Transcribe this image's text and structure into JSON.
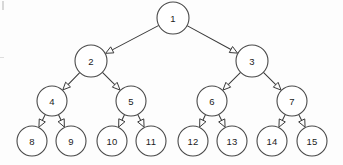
{
  "diagram": {
    "background_color": "#fdfdfd",
    "node_stroke_color": "#4a4a4a",
    "node_fill_color": "#ffffff",
    "edge_color": "#3a3a3a",
    "arrow_style": "open-triangle",
    "levels": 4,
    "node_count": 15
  },
  "nodes": [
    {
      "id": "n1",
      "label": "1",
      "cx": 173,
      "cy": 18,
      "r": 16,
      "level": 0
    },
    {
      "id": "n2",
      "label": "2",
      "cx": 91,
      "cy": 61,
      "r": 16,
      "level": 1
    },
    {
      "id": "n3",
      "label": "3",
      "cx": 252,
      "cy": 61,
      "r": 16,
      "level": 1
    },
    {
      "id": "n4",
      "label": "4",
      "cx": 52,
      "cy": 101,
      "r": 15,
      "level": 2
    },
    {
      "id": "n5",
      "label": "5",
      "cx": 131,
      "cy": 101,
      "r": 15,
      "level": 2
    },
    {
      "id": "n6",
      "label": "6",
      "cx": 212,
      "cy": 101,
      "r": 15,
      "level": 2
    },
    {
      "id": "n7",
      "label": "7",
      "cx": 292,
      "cy": 101,
      "r": 15,
      "level": 2
    },
    {
      "id": "n8",
      "label": "8",
      "cx": 32,
      "cy": 141,
      "r": 15,
      "level": 3
    },
    {
      "id": "n9",
      "label": "9",
      "cx": 71,
      "cy": 141,
      "r": 15,
      "level": 3
    },
    {
      "id": "n10",
      "label": "10",
      "cx": 112,
      "cy": 141,
      "r": 15,
      "level": 3
    },
    {
      "id": "n11",
      "label": "11",
      "cx": 151,
      "cy": 141,
      "r": 15,
      "level": 3
    },
    {
      "id": "n12",
      "label": "12",
      "cx": 193,
      "cy": 141,
      "r": 15,
      "level": 3
    },
    {
      "id": "n13",
      "label": "13",
      "cx": 232,
      "cy": 141,
      "r": 15,
      "level": 3
    },
    {
      "id": "n14",
      "label": "14",
      "cx": 272,
      "cy": 141,
      "r": 15,
      "level": 3
    },
    {
      "id": "n15",
      "label": "15",
      "cx": 312,
      "cy": 141,
      "r": 15,
      "level": 3
    }
  ],
  "edges": [
    {
      "from": "n1",
      "to": "n2"
    },
    {
      "from": "n1",
      "to": "n3"
    },
    {
      "from": "n2",
      "to": "n4"
    },
    {
      "from": "n2",
      "to": "n5"
    },
    {
      "from": "n3",
      "to": "n6"
    },
    {
      "from": "n3",
      "to": "n7"
    },
    {
      "from": "n4",
      "to": "n8"
    },
    {
      "from": "n4",
      "to": "n9"
    },
    {
      "from": "n5",
      "to": "n10"
    },
    {
      "from": "n5",
      "to": "n11"
    },
    {
      "from": "n6",
      "to": "n12"
    },
    {
      "from": "n6",
      "to": "n13"
    },
    {
      "from": "n7",
      "to": "n14"
    },
    {
      "from": "n7",
      "to": "n15"
    }
  ],
  "artifacts": [
    {
      "id": "artifact-top-left",
      "name": "scan-artifact-top-left"
    },
    {
      "id": "artifact-mid-left",
      "name": "scan-artifact-mid-left"
    }
  ]
}
